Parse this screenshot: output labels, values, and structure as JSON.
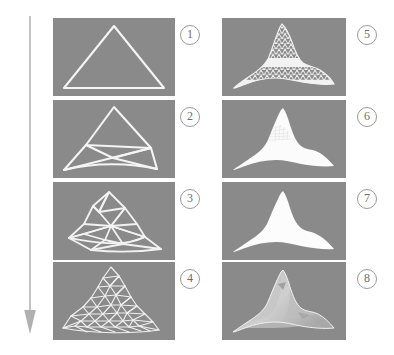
{
  "figure": {
    "title": "",
    "background_color": "#ffffff",
    "panel_color": "#8a8a8a",
    "stroke_color": "#f2f2f2",
    "label_color": "#6e6e6e",
    "arrow": {
      "name": "progression-arrow",
      "direction": "down",
      "color": "#b0b0b0"
    },
    "columns": 2,
    "rows": 4,
    "panels": [
      {
        "id": 1,
        "label": "①",
        "label_text": "1",
        "column": "left",
        "row": 1,
        "content": "coarse-triangle-outline",
        "description": "single large triangle outline"
      },
      {
        "id": 2,
        "label": "②",
        "label_text": "2",
        "column": "left",
        "row": 2,
        "content": "subdivided-triangle-level-1",
        "description": "triangle subdivided into a few triangles"
      },
      {
        "id": 3,
        "label": "③",
        "label_text": "3",
        "column": "left",
        "row": 3,
        "content": "subdivided-triangle-level-2",
        "description": "triangle mesh with displaced vertices"
      },
      {
        "id": 4,
        "label": "④",
        "label_text": "4",
        "column": "left",
        "row": 4,
        "content": "triangle-mesh-level-3",
        "description": "denser triangle mesh forming mountain silhouette"
      },
      {
        "id": 5,
        "label": "⑤",
        "label_text": "5",
        "column": "right",
        "row": 1,
        "content": "triangle-mesh-level-4",
        "description": "very dense wireframe mountain mesh"
      },
      {
        "id": 6,
        "label": "⑥",
        "label_text": "6",
        "column": "right",
        "row": 2,
        "content": "filled-mountain-faint-wireframe",
        "description": "filled white mountain with faint residual wireframe"
      },
      {
        "id": 7,
        "label": "⑦",
        "label_text": "7",
        "column": "right",
        "row": 3,
        "content": "filled-mountain-silhouette",
        "description": "solid white mountain silhouette"
      },
      {
        "id": 8,
        "label": "⑧",
        "label_text": "8",
        "column": "right",
        "row": 4,
        "content": "shaded-mountain-render",
        "description": "shaded grey mountain render with lighting"
      }
    ]
  }
}
